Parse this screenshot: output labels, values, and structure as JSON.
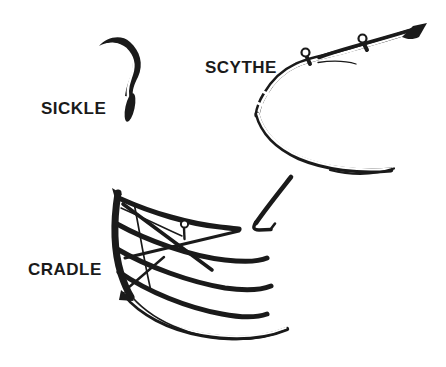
{
  "colors": {
    "ink": "#1a1a1a",
    "background": "#ffffff"
  },
  "labels": {
    "sickle": "SICKLE",
    "scythe": "SCYTHE",
    "cradle": "CRADLE"
  },
  "illustrations": [
    {
      "name": "sickle-drawing",
      "label": "SICKLE"
    },
    {
      "name": "scythe-drawing",
      "label": "SCYTHE"
    },
    {
      "name": "cradle-drawing",
      "label": "CRADLE"
    }
  ]
}
